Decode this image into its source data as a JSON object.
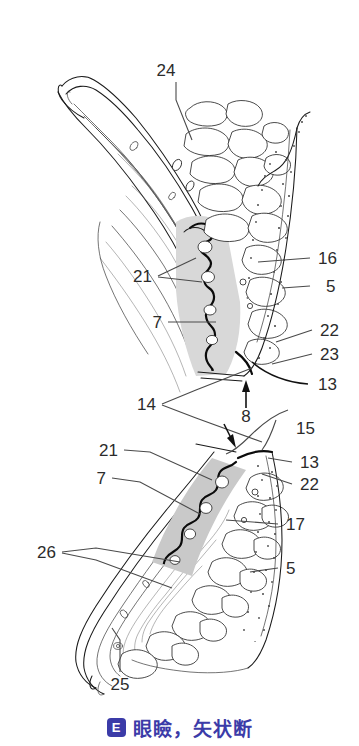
{
  "figure": {
    "title_badge": "E",
    "title_text": "眼瞼，矢状断",
    "caption_color": "#3b3ba8",
    "background_color": "#ffffff",
    "ink_color": "#1a1a1a"
  },
  "labels": {
    "l24": "24",
    "l21_upper": "21",
    "l16": "16",
    "l5_upper": "5",
    "l7_upper": "7",
    "l22_upper": "22",
    "l23": "23",
    "l13_upper": "13",
    "l14": "14",
    "l8": "8",
    "l15": "15",
    "l21_lower": "21",
    "l13_lower": "13",
    "l22_lower": "22",
    "l7_lower": "7",
    "l17": "17",
    "l26": "26",
    "l5_lower": "5",
    "l25": "25"
  }
}
